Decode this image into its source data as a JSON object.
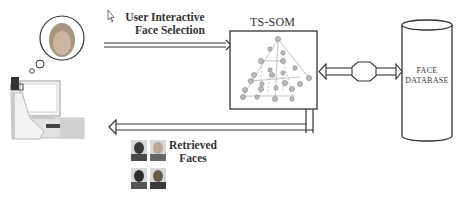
{
  "diagram": {
    "type": "system-architecture",
    "nodes": {
      "user": {
        "icon": "user-at-computer-icon",
        "thought_icon": "thought-bubble-face-icon"
      },
      "som": {
        "title": "TS-SOM",
        "icon": "tree-structured-som-pyramid-icon"
      },
      "database": {
        "line1": "FACE",
        "line2": "DATABASE",
        "icon": "cylinder-database-icon"
      }
    },
    "edges": {
      "selection": {
        "line1": "User Interactive",
        "line2": "Face Selection",
        "from": "user",
        "to": "som",
        "icon": "cursor-pointer-icon"
      },
      "som_db": {
        "from": "som",
        "to": "database",
        "bidirectional": true
      },
      "retrieval": {
        "line1": "Retrieved",
        "line2": "Faces",
        "from": "som",
        "to": "user"
      }
    },
    "retrieved_faces": [
      "face-1",
      "face-2",
      "face-3",
      "face-4"
    ],
    "colors": {
      "line": "#333333",
      "fill": "#ffffff",
      "node": "#bbbbbb"
    }
  }
}
